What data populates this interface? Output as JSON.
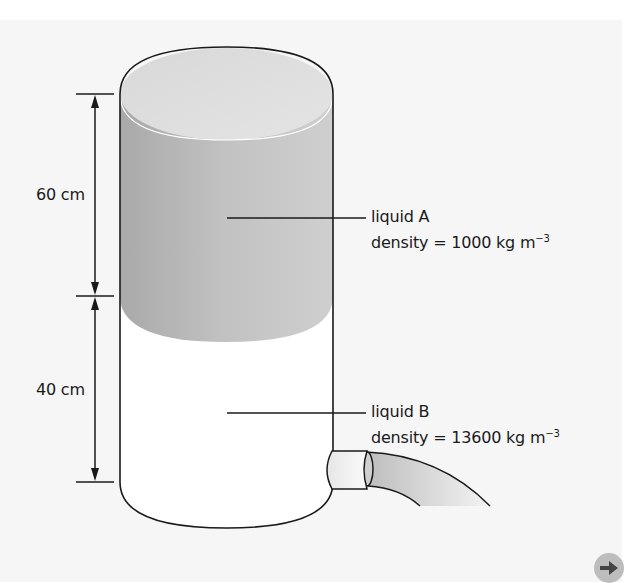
{
  "diagram": {
    "dimensions": [
      {
        "label": "60 cm",
        "from": "top of liquid A",
        "to": "liquid interface"
      },
      {
        "label": "40 cm",
        "from": "liquid interface",
        "to": "bottom of cylinder"
      }
    ],
    "liquids": [
      {
        "name": "liquid A",
        "density_text": "density = 1000 kg m",
        "exponent": "−3",
        "color": "#b9b9b9"
      },
      {
        "name": "liquid B",
        "density_text": "density = 13600 kg m",
        "exponent": "−3",
        "color": "#ffffff"
      }
    ],
    "colors": {
      "background": "#f6f6f6",
      "liquid_a": "#b9b9b9",
      "liquid_b": "#ffffff",
      "outline": "#1a1a1a",
      "button": "#bdbdbd"
    }
  },
  "navigation": {
    "next_button_icon": "arrow-right-icon"
  }
}
